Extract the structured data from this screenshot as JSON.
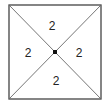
{
  "diagram": {
    "type": "square-with-diagonals",
    "stroke_color": "#444444",
    "dot_color": "#111111",
    "regions": [
      {
        "position": "top",
        "label": "2"
      },
      {
        "position": "left",
        "label": "2"
      },
      {
        "position": "right",
        "label": "2"
      },
      {
        "position": "bottom",
        "label": "2"
      }
    ]
  }
}
